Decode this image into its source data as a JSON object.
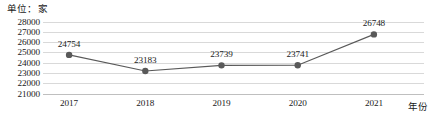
{
  "chart_data": {
    "type": "line",
    "title": "",
    "subtitle": "",
    "unit_label": "单位：家",
    "xlabel": "年份",
    "ylabel": "",
    "categories": [
      "2017",
      "2018",
      "2019",
      "2020",
      "2021"
    ],
    "values": [
      24754,
      23183,
      23739,
      23741,
      26748
    ],
    "data_labels": [
      "24754",
      "23183",
      "23739",
      "23741",
      "26748"
    ],
    "ylim": [
      21000,
      28000
    ],
    "ytick_values": [
      28000,
      27000,
      26000,
      25000,
      24000,
      23000,
      22000,
      21000
    ],
    "ytick_labels": [
      "28000",
      "27000",
      "26000",
      "25000",
      "24000",
      "23000",
      "22000",
      "21000"
    ],
    "grid": true,
    "legend": false,
    "legend_position": "none",
    "series": [
      {
        "name": "企业数量",
        "values": [
          24754,
          23183,
          23739,
          23741,
          26748
        ],
        "color": "#595959",
        "marker": "circle"
      }
    ],
    "colors": {
      "line": "#595959",
      "marker": "#595959",
      "gridline": "#d9d9d9",
      "axis": "#bfbfbf",
      "text": "#1a1a1a",
      "background": "#ffffff"
    }
  }
}
